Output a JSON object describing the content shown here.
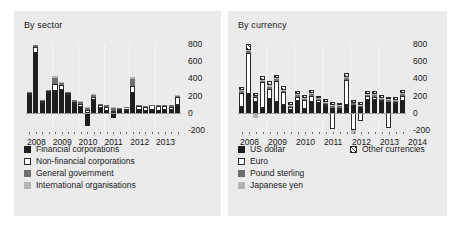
{
  "figure": {
    "background": "#ffffff",
    "panel_background": "#ebebeb"
  },
  "colors": {
    "dark": "#1e1e1e",
    "white": "#ffffff",
    "mid": "#6e6e6e",
    "light": "#b4b4b4",
    "hatch": "#ffffff",
    "zero_axis": "#9a9a9a",
    "gridline": "#f7f7f7"
  },
  "panels": [
    {
      "key": "by_sector",
      "title": "By sector",
      "legend": [
        {
          "label": "Financial corporations",
          "swatch": "dark"
        },
        {
          "label": "Non-financial corporations",
          "swatch": "white"
        },
        {
          "label": "General government",
          "swatch": "mid"
        },
        {
          "label": "International organisations",
          "swatch": "light"
        }
      ]
    },
    {
      "key": "by_currency",
      "title": "By currency",
      "legend": [
        {
          "label": "US dollar",
          "swatch": "dark"
        },
        {
          "label": "Euro",
          "swatch": "white"
        },
        {
          "label": "Pound sterling",
          "swatch": "mid"
        },
        {
          "label": "Japanese yen",
          "swatch": "light"
        },
        {
          "label": "Other currencies",
          "swatch": "hatch"
        }
      ]
    }
  ],
  "chart_data": [
    {
      "type": "bar",
      "id": "by_sector",
      "title": "By sector",
      "stacked": true,
      "xlabel": "",
      "ylabel": "",
      "ylim": [
        -200,
        800
      ],
      "yticks": [
        -200,
        0,
        200,
        400,
        600,
        800
      ],
      "ytick_labels": [
        "-200",
        "0",
        "200",
        "400",
        "600",
        "800"
      ],
      "grid": "vertical-year-separators",
      "legend_position": "below-left",
      "x_axis_tick_labels": [
        "2008",
        "2009",
        "2010",
        "2011",
        "2012",
        "2013"
      ],
      "x_frequency": "quarterly",
      "categories": [
        "2008Q1",
        "2008Q2",
        "2008Q3",
        "2008Q4",
        "2009Q1",
        "2009Q2",
        "2009Q3",
        "2009Q4",
        "2010Q1",
        "2010Q2",
        "2010Q3",
        "2010Q4",
        "2011Q1",
        "2011Q2",
        "2011Q3",
        "2011Q4",
        "2012Q1",
        "2012Q2",
        "2012Q3",
        "2012Q4",
        "2013Q1",
        "2013Q2",
        "2013Q3",
        "2013Q4"
      ],
      "series": [
        {
          "name": "Financial corporations",
          "swatch": "dark",
          "values": [
            215,
            700,
            120,
            235,
            250,
            265,
            215,
            110,
            70,
            -150,
            145,
            55,
            25,
            -60,
            25,
            30,
            235,
            30,
            25,
            35,
            20,
            30,
            30,
            85
          ]
        },
        {
          "name": "Non-financial corporations",
          "swatch": "white",
          "values": [
            10,
            70,
            15,
            15,
            90,
            60,
            15,
            15,
            35,
            35,
            40,
            35,
            45,
            25,
            15,
            20,
            80,
            45,
            45,
            50,
            55,
            50,
            40,
            95
          ]
        },
        {
          "name": "General government",
          "swatch": "mid",
          "values": [
            15,
            20,
            10,
            15,
            65,
            20,
            10,
            20,
            25,
            20,
            25,
            15,
            20,
            35,
            15,
            20,
            80,
            10,
            10,
            10,
            15,
            15,
            20,
            20
          ]
        },
        {
          "name": "International organisations",
          "swatch": "light",
          "values": [
            5,
            5,
            5,
            5,
            20,
            10,
            5,
            5,
            10,
            10,
            10,
            5,
            5,
            10,
            5,
            5,
            20,
            5,
            5,
            5,
            5,
            5,
            5,
            10
          ]
        }
      ]
    },
    {
      "type": "bar",
      "id": "by_currency",
      "title": "By currency",
      "stacked": true,
      "xlabel": "",
      "ylabel": "",
      "ylim": [
        -200,
        800
      ],
      "yticks": [
        -200,
        0,
        200,
        400,
        600,
        800
      ],
      "ytick_labels": [
        "-200",
        "0",
        "200",
        "400",
        "600",
        "800"
      ],
      "grid": "vertical-year-separators",
      "legend_position": "below-left",
      "x_axis_tick_labels": [
        "2008",
        "2009",
        "2010",
        "2011",
        "2012",
        "2013",
        "2014"
      ],
      "x_frequency": "quarterly",
      "categories": [
        "2008Q1",
        "2008Q2",
        "2008Q3",
        "2008Q4",
        "2009Q1",
        "2009Q2",
        "2009Q3",
        "2009Q4",
        "2010Q1",
        "2010Q2",
        "2010Q3",
        "2010Q4",
        "2011Q1",
        "2011Q2",
        "2011Q3",
        "2011Q4",
        "2012Q1",
        "2012Q2",
        "2012Q3",
        "2012Q4",
        "2013Q1",
        "2013Q2",
        "2013Q3",
        "2013Q4"
      ],
      "series": [
        {
          "name": "US dollar",
          "swatch": "dark",
          "values": [
            65,
            215,
            125,
            55,
            155,
            120,
            85,
            35,
            140,
            45,
            130,
            115,
            75,
            55,
            35,
            85,
            95,
            65,
            150,
            145,
            120,
            125,
            105,
            140
          ]
        },
        {
          "name": "Euro",
          "swatch": "white",
          "values": [
            165,
            485,
            55,
            300,
            120,
            250,
            160,
            30,
            45,
            105,
            65,
            30,
            30,
            -185,
            25,
            300,
            -205,
            -95,
            40,
            35,
            25,
            -180,
            20,
            60
          ]
        },
        {
          "name": "Pound sterling",
          "swatch": "mid",
          "values": [
            20,
            25,
            20,
            15,
            30,
            20,
            15,
            15,
            20,
            15,
            20,
            15,
            15,
            20,
            15,
            20,
            20,
            15,
            20,
            25,
            20,
            20,
            15,
            20
          ]
        },
        {
          "name": "Japanese yen",
          "swatch": "light",
          "values": [
            10,
            10,
            -55,
            10,
            15,
            10,
            10,
            10,
            10,
            10,
            10,
            10,
            10,
            10,
            10,
            10,
            -40,
            10,
            10,
            10,
            10,
            10,
            10,
            10
          ]
        },
        {
          "name": "Other currencies",
          "swatch": "hatch",
          "values": [
            45,
            70,
            35,
            45,
            55,
            40,
            40,
            30,
            35,
            35,
            35,
            30,
            30,
            35,
            30,
            45,
            35,
            30,
            35,
            35,
            30,
            30,
            30,
            40
          ]
        }
      ]
    }
  ]
}
